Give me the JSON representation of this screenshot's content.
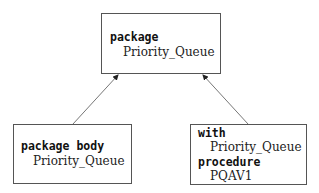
{
  "diagram": {
    "type": "dependency-diagram",
    "nodes": [
      {
        "id": "spec",
        "lines": [
          {
            "text": "package",
            "style": "keyword"
          },
          {
            "text": "Priority_Queue",
            "style": "identifier"
          }
        ]
      },
      {
        "id": "body",
        "lines": [
          {
            "text": "package body",
            "style": "keyword"
          },
          {
            "text": "Priority_Queue",
            "style": "identifier"
          }
        ]
      },
      {
        "id": "client",
        "lines": [
          {
            "text": "with",
            "style": "keyword"
          },
          {
            "text": "Priority_Queue",
            "style": "identifier"
          },
          {
            "text": "procedure",
            "style": "keyword"
          },
          {
            "text": "PQAV1",
            "style": "identifier"
          }
        ]
      }
    ],
    "edges": [
      {
        "from": "body",
        "to": "spec"
      },
      {
        "from": "client",
        "to": "spec"
      }
    ]
  }
}
